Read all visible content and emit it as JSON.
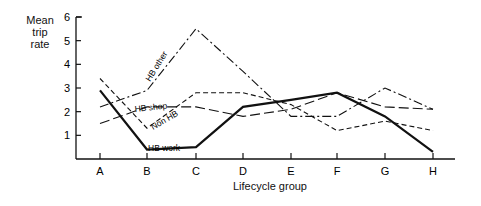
{
  "chart_data": {
    "type": "line",
    "title": "",
    "xlabel": "Lifecycle group",
    "ylabel": "Mean trip rate",
    "ylabel_lines": [
      "Mean",
      "trip",
      "rate"
    ],
    "categories": [
      "A",
      "B",
      "C",
      "D",
      "E",
      "F",
      "G",
      "H"
    ],
    "yticks": [
      1,
      2,
      3,
      4,
      5,
      6
    ],
    "ylim": [
      0,
      6
    ],
    "grid": false,
    "legend": "inline labels",
    "series": [
      {
        "name": "HB work",
        "style": "solid-thick",
        "values": [
          2.9,
          0.4,
          0.5,
          2.2,
          2.5,
          2.8,
          1.8,
          0.3
        ]
      },
      {
        "name": "HB other",
        "style": "dash-dot",
        "values": [
          2.2,
          2.9,
          5.5,
          3.7,
          1.8,
          1.8,
          3.0,
          2.1
        ]
      },
      {
        "name": "HB shop",
        "style": "long-dash",
        "values": [
          1.5,
          2.2,
          2.2,
          1.8,
          2.1,
          2.8,
          2.2,
          2.1
        ]
      },
      {
        "name": "Non HB",
        "style": "short-dash",
        "values": [
          3.4,
          1.3,
          2.8,
          2.8,
          2.3,
          1.2,
          1.6,
          1.2
        ]
      }
    ]
  }
}
